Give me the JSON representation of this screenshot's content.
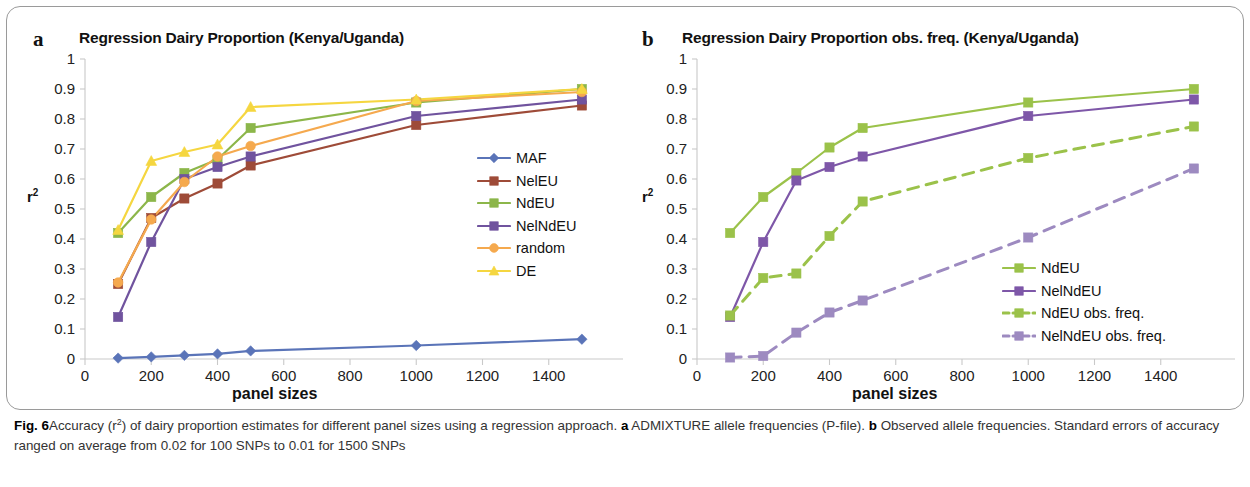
{
  "figure": {
    "caption_label": "Fig. 6",
    "caption_part1": "Accuracy (r",
    "caption_sup1": "2",
    "caption_part2": ") of dairy proportion estimates for different panel sizes using a regression approach. ",
    "caption_bold_a": "a",
    "caption_part3": " ADMIXTURE allele frequencies (P-file). ",
    "caption_bold_b": "b",
    "caption_part4": " Observed allele frequencies. Standard errors of accuracy ranged on average from 0.02 for 100 SNPs to 0.01 for 1500 SNPs"
  },
  "panel_a": {
    "letter": "a",
    "title": "Regression Dairy Proportion (Kenya/Uganda)",
    "ylabel_text": "r",
    "ylabel_sup": "2",
    "xlabel": "panel sizes"
  },
  "panel_b": {
    "letter": "b",
    "title": "Regression Dairy Proportion obs. freq. (Kenya/Uganda)",
    "ylabel_text": "r",
    "ylabel_sup": "2",
    "xlabel": "panel sizes"
  },
  "chart_data": [
    {
      "type": "line",
      "panel": "a",
      "title": "Regression Dairy Proportion (Kenya/Uganda)",
      "xlabel": "panel sizes",
      "ylabel": "r2",
      "xlim": [
        0,
        1600
      ],
      "ylim": [
        0,
        1
      ],
      "xticks": [
        0,
        200,
        400,
        600,
        800,
        1000,
        1200,
        1400
      ],
      "yticks": [
        0,
        0.1,
        0.2,
        0.3,
        0.4,
        0.5,
        0.6,
        0.7,
        0.8,
        0.9,
        1
      ],
      "grid": false,
      "legend_position": "right-inside",
      "x": [
        100,
        200,
        300,
        400,
        500,
        1000,
        1500
      ],
      "series": [
        {
          "name": "MAF",
          "color": "#5a74b8",
          "marker": "diamond",
          "dash": false,
          "values": [
            0.003,
            0.007,
            0.012,
            0.017,
            0.027,
            0.045,
            0.066
          ]
        },
        {
          "name": "NelEU",
          "color": "#9e4b38",
          "marker": "square",
          "dash": false,
          "values": [
            0.25,
            0.47,
            0.535,
            0.585,
            0.645,
            0.78,
            0.845
          ]
        },
        {
          "name": "NdEU",
          "color": "#8cb64a",
          "marker": "square",
          "dash": false,
          "values": [
            0.42,
            0.54,
            0.62,
            0.665,
            0.77,
            0.855,
            0.9
          ]
        },
        {
          "name": "NelNdEU",
          "color": "#70539e",
          "marker": "square",
          "dash": false,
          "values": [
            0.14,
            0.39,
            0.6,
            0.64,
            0.675,
            0.81,
            0.865
          ]
        },
        {
          "name": "random",
          "color": "#f5a94e",
          "marker": "circle",
          "dash": false,
          "values": [
            0.255,
            0.465,
            0.59,
            0.675,
            0.71,
            0.86,
            0.89
          ]
        },
        {
          "name": "DE",
          "color": "#f5d640",
          "marker": "triangle",
          "dash": false,
          "values": [
            0.43,
            0.66,
            0.69,
            0.715,
            0.84,
            0.865,
            0.9
          ]
        }
      ]
    },
    {
      "type": "line",
      "panel": "b",
      "title": "Regression Dairy Proportion obs. freq. (Kenya/Uganda)",
      "xlabel": "panel sizes",
      "ylabel": "r2",
      "xlim": [
        0,
        1600
      ],
      "ylim": [
        0,
        1
      ],
      "xticks": [
        0,
        200,
        400,
        600,
        800,
        1000,
        1200,
        1400
      ],
      "yticks": [
        0,
        0.1,
        0.2,
        0.3,
        0.4,
        0.5,
        0.6,
        0.7,
        0.8,
        0.9,
        1
      ],
      "grid": false,
      "legend_position": "right-inside",
      "x": [
        100,
        200,
        300,
        400,
        500,
        1000,
        1500
      ],
      "series": [
        {
          "name": "NdEU",
          "color": "#9bc24a",
          "marker": "square",
          "dash": false,
          "values": [
            0.42,
            0.54,
            0.62,
            0.705,
            0.77,
            0.855,
            0.9
          ]
        },
        {
          "name": "NelNdEU",
          "color": "#7e57a8",
          "marker": "square",
          "dash": false,
          "values": [
            0.14,
            0.39,
            0.595,
            0.64,
            0.675,
            0.81,
            0.865
          ]
        },
        {
          "name": "NdEU obs. freq.",
          "color": "#9bc24a",
          "marker": "square",
          "dash": true,
          "values": [
            0.145,
            0.27,
            0.285,
            0.41,
            0.525,
            0.67,
            0.775
          ]
        },
        {
          "name": "NelNdEU obs. freq.",
          "color": "#9d8ac0",
          "marker": "square",
          "dash": true,
          "values": [
            0.005,
            0.01,
            0.088,
            0.155,
            0.195,
            0.405,
            0.635
          ]
        }
      ]
    }
  ]
}
